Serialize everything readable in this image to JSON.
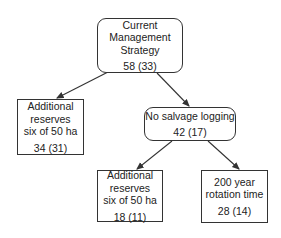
{
  "nodes": {
    "root": {
      "lines": [
        "Current",
        "Management",
        "Strategy"
      ],
      "value": "58 (33)"
    },
    "left_reserves": {
      "lines": [
        "Additional",
        "reserves",
        "six of 50 ha"
      ],
      "value": "34 (31)"
    },
    "no_salvage": {
      "lines": [
        "No salvage logging"
      ],
      "value": "42 (17)"
    },
    "sub_reserves": {
      "lines": [
        "Additional",
        "reserves",
        "six of 50 ha"
      ],
      "value": "18 (11)"
    },
    "rotation": {
      "lines": [
        "200 year",
        "rotation time"
      ],
      "value": "28 (14)"
    }
  },
  "edges": [
    {
      "from": "root",
      "to": "left_reserves"
    },
    {
      "from": "root",
      "to": "no_salvage"
    },
    {
      "from": "no_salvage",
      "to": "sub_reserves"
    },
    {
      "from": "no_salvage",
      "to": "rotation"
    }
  ],
  "colors": {
    "stroke": "#333333",
    "background": "#ffffff"
  }
}
